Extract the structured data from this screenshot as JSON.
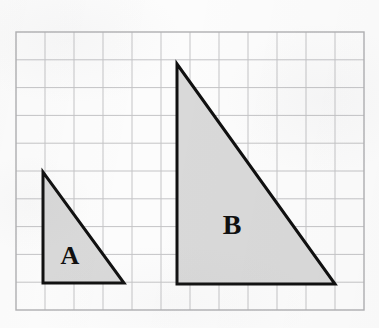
{
  "figure": {
    "background_color": "#fcfcfc"
  },
  "grid": {
    "name": "square-grid",
    "columns": 12,
    "rows": 10,
    "origin_x": 16,
    "origin_y": 32,
    "cell_width": 29.0,
    "cell_height": 27.8,
    "line_color": "#c4c4c6",
    "border_color": "#b0b0b2",
    "line_width": 1
  },
  "shapes": [
    {
      "id": "triangle-a",
      "label": "A",
      "type": "right-triangle",
      "fill": "#d9d9d9",
      "stroke": "#101010",
      "stroke_width": 3,
      "grid_width_cells": 3,
      "grid_height_cells": 4,
      "vertices": [
        {
          "x": 43,
          "y": 172
        },
        {
          "x": 43,
          "y": 283
        },
        {
          "x": 124,
          "y": 283
        }
      ],
      "label_position": {
        "x": 70,
        "y": 258
      },
      "label_font_size": 26
    },
    {
      "id": "triangle-b",
      "label": "B",
      "type": "right-triangle",
      "fill": "#d9d9d9",
      "stroke": "#101010",
      "stroke_width": 3,
      "grid_width_cells": 5.5,
      "grid_height_cells": 8,
      "vertices": [
        {
          "x": 177,
          "y": 64
        },
        {
          "x": 177,
          "y": 284
        },
        {
          "x": 335,
          "y": 284
        }
      ],
      "label_position": {
        "x": 232,
        "y": 228
      },
      "label_font_size": 28
    }
  ]
}
